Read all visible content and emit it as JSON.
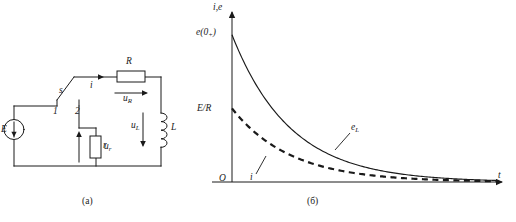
{
  "figure": {
    "kind": "textbook-figure",
    "panels": [
      {
        "id": "a",
        "caption": "(a)",
        "type": "circuit-schematic"
      },
      {
        "id": "b",
        "caption": "(б)",
        "type": "plot"
      }
    ]
  },
  "circuit": {
    "caption": "(a)",
    "source_label": "E",
    "switch_label": "s",
    "switch_contact_1": "1",
    "switch_contact_2": "2",
    "resistor_r_label": "r",
    "voltage_ur_label": "u",
    "voltage_ur_sub": "r",
    "resistor_R_label": "R",
    "voltage_uR_label": "u",
    "voltage_uR_sub": "R",
    "inductor_label": "L",
    "voltage_uL_label": "u",
    "voltage_uL_sub": "L",
    "current_label": "i",
    "colors": {
      "wire": "#1a1a1a",
      "background": "#ffffff"
    }
  },
  "chart_data": {
    "type": "line",
    "title": "",
    "caption": "(б)",
    "xlabel": "t",
    "ylabel": "i,e",
    "origin_label": "O",
    "grid": false,
    "legend": "inline-annotations",
    "xlim": [
      0,
      10
    ],
    "ylim": [
      0,
      1.05
    ],
    "y_tick_labels": [
      {
        "text": "e(0",
        "sub": "+",
        "text_tail": ")",
        "value": 0.92
      },
      {
        "text": "E/R",
        "value": 0.46
      }
    ],
    "annotations": [
      {
        "text": "e",
        "sub": "L",
        "series": "e_L",
        "x": 4.2,
        "y": 0.18
      },
      {
        "text": "i",
        "sub": "",
        "series": "i",
        "x": 1.7,
        "y": 0.07
      }
    ],
    "series": [
      {
        "name": "e_L",
        "label": "e_L",
        "style": "solid",
        "color": "#1a1a1a",
        "y0": 0.92,
        "tau": 2.2,
        "x": [
          0,
          0.5,
          1,
          1.5,
          2,
          2.5,
          3,
          3.5,
          4,
          4.5,
          5,
          5.5,
          6,
          6.5,
          7,
          7.5,
          8,
          8.5,
          9,
          9.5,
          10
        ],
        "values": [
          0.92,
          0.73,
          0.59,
          0.47,
          0.37,
          0.3,
          0.24,
          0.19,
          0.15,
          0.12,
          0.1,
          0.08,
          0.06,
          0.05,
          0.04,
          0.03,
          0.025,
          0.02,
          0.016,
          0.013,
          0.01
        ]
      },
      {
        "name": "i",
        "label": "i",
        "style": "dashed",
        "color": "#1a1a1a",
        "y0": 0.46,
        "tau": 2.2,
        "x": [
          0,
          0.5,
          1,
          1.5,
          2,
          2.5,
          3,
          3.5,
          4,
          4.5,
          5,
          5.5,
          6,
          6.5,
          7,
          7.5,
          8,
          8.5,
          9,
          9.5,
          10
        ],
        "values": [
          0.46,
          0.37,
          0.29,
          0.23,
          0.19,
          0.15,
          0.12,
          0.095,
          0.076,
          0.061,
          0.049,
          0.039,
          0.031,
          0.025,
          0.02,
          0.016,
          0.013,
          0.01,
          0.008,
          0.006,
          0.005
        ]
      }
    ]
  }
}
